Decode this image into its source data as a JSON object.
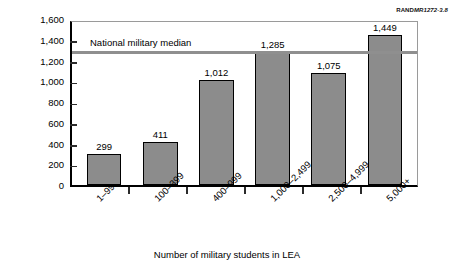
{
  "source_id": {
    "prefix": "RAND",
    "number": "MR1272-3.8"
  },
  "chart_data": {
    "type": "bar",
    "title": "",
    "xlabel": "Number of military students in LEA",
    "ylabel": "Median LOT payment per WFSU ($)",
    "categories": [
      "1–99",
      "100–399",
      "400–999",
      "1,000–2,499",
      "2,500–4,999",
      "5,000+"
    ],
    "values": [
      299,
      411,
      1012,
      1285,
      1075,
      1449
    ],
    "value_labels": [
      "299",
      "411",
      "1,012",
      "1,285",
      "1,075",
      "1,449"
    ],
    "ylim": [
      0,
      1600
    ],
    "ytick_values": [
      0,
      200,
      400,
      600,
      800,
      1000,
      1200,
      1400,
      1600
    ],
    "ytick_labels": [
      "0",
      "200",
      "400",
      "600",
      "800",
      "1,000",
      "1,200",
      "1,400",
      "1,600"
    ],
    "grid": false,
    "legend_position": "none",
    "bar_color": "#8c8c8c",
    "bar_edge_color": "#000000",
    "annotations": [
      {
        "name": "national-military-median",
        "label": "National military median",
        "value": 1320,
        "color": "#8f8f8f",
        "orientation": "horizontal"
      }
    ]
  }
}
